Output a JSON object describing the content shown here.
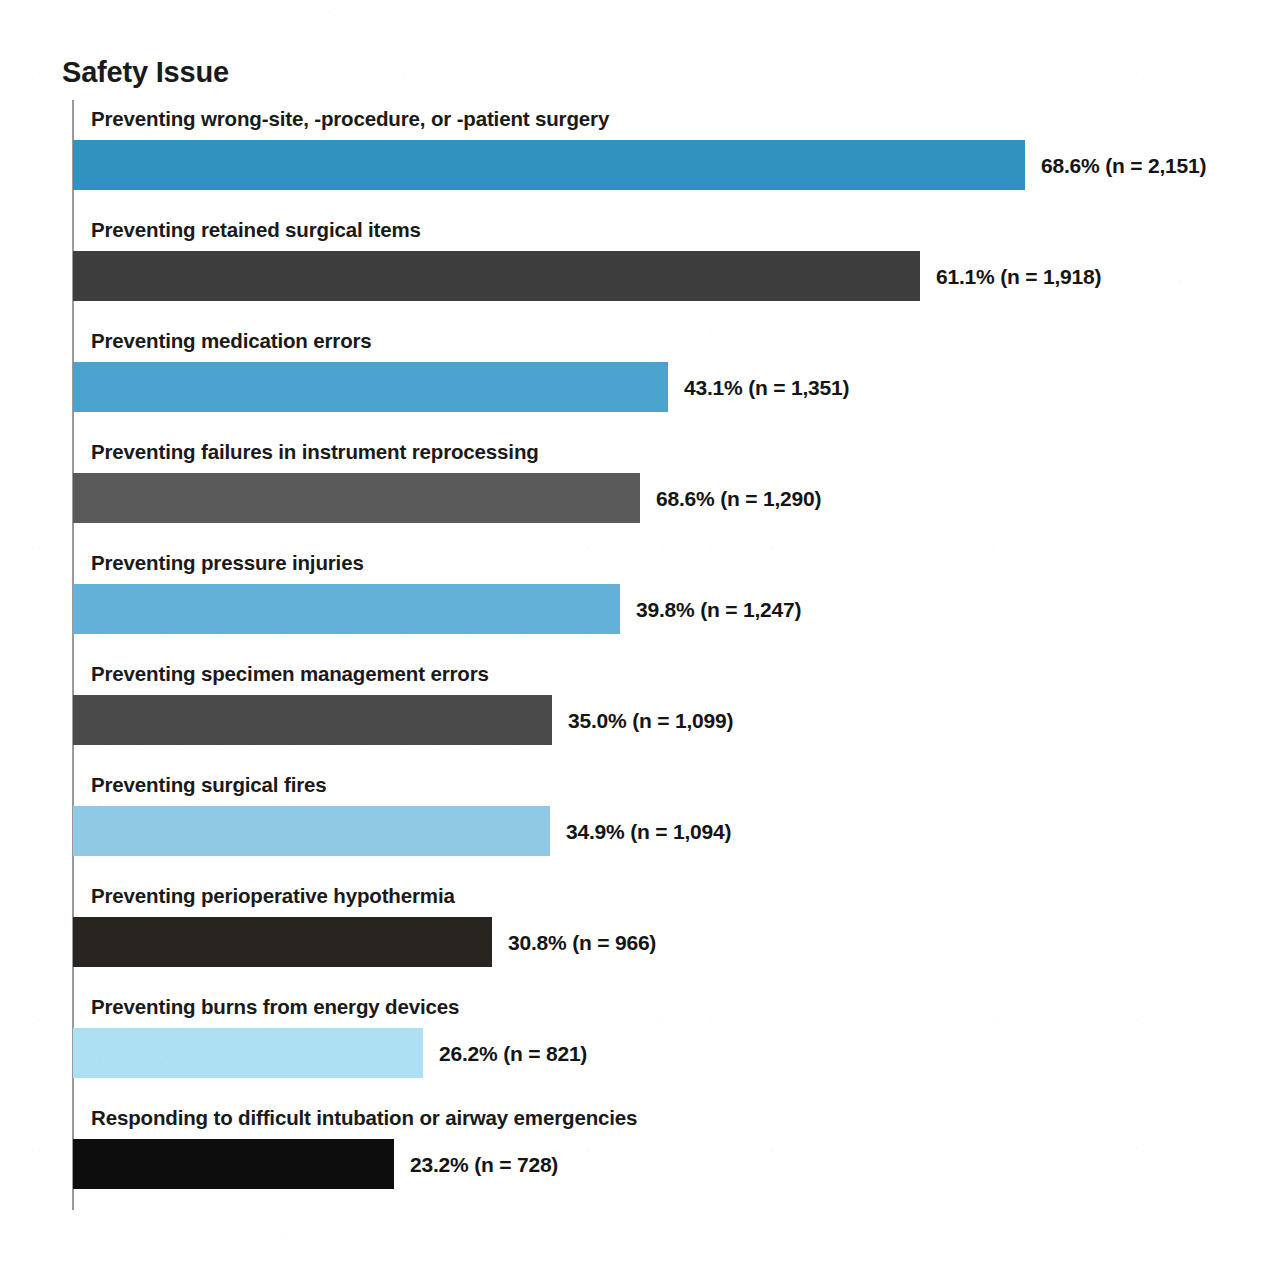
{
  "chart_data": {
    "type": "bar",
    "orientation": "horizontal",
    "title": "Safety Issue",
    "xlabel": "",
    "ylabel": "Safety Issue",
    "grid": false,
    "legend": null,
    "axis": {
      "category_axis_visible": true,
      "value_axis_visible": false,
      "value_range_n": [
        0,
        2500
      ]
    },
    "categories": [
      "Preventing wrong-site, -procedure, or -patient surgery",
      "Preventing retained surgical items",
      "Preventing medication errors",
      "Preventing failures in instrument reprocessing",
      "Preventing pressure injuries",
      "Preventing specimen management errors",
      "Preventing surgical fires",
      "Preventing perioperative hypothermia",
      "Preventing burns from energy devices",
      "Responding to difficult intubation or airway emergencies"
    ],
    "values": [
      2151,
      1918,
      1351,
      1290,
      1247,
      1099,
      1094,
      966,
      821,
      728
    ],
    "percentages": [
      68.6,
      61.1,
      43.1,
      68.6,
      39.8,
      35.0,
      34.9,
      30.8,
      26.2,
      23.2
    ],
    "value_labels": [
      "68.6% (n = 2,151)",
      "61.1% (n = 1,918)",
      "43.1% (n = 1,351)",
      "68.6% (n = 1,290)",
      "39.8% (n = 1,247)",
      "35.0% (n = 1,099)",
      "34.9% (n = 1,094)",
      "30.8% (n = 966)",
      "26.2% (n = 821)",
      "23.2% (n = 728)"
    ],
    "bar_colors": [
      "#3092bf",
      "#3d3d3d",
      "#4aa3ce",
      "#5a5a5a",
      "#63b0d8",
      "#4a4a4a",
      "#8ecae3",
      "#282420",
      "#ace0f2",
      "#0d0d0d"
    ],
    "bar_pixel_widths": [
      952,
      847,
      595,
      567,
      547,
      479,
      477,
      419,
      350,
      321
    ]
  },
  "rows": [
    {
      "label": "Preventing wrong-site, -procedure, or -patient surgery",
      "value_label": "68.6% (n = 2,151)"
    },
    {
      "label": "Preventing retained surgical items",
      "value_label": "61.1% (n = 1,918)"
    },
    {
      "label": "Preventing medication errors",
      "value_label": "43.1% (n = 1,351)"
    },
    {
      "label": "Preventing failures in instrument reprocessing",
      "value_label": "68.6% (n = 1,290)"
    },
    {
      "label": "Preventing pressure injuries",
      "value_label": "39.8% (n = 1,247)"
    },
    {
      "label": "Preventing specimen management errors",
      "value_label": "35.0% (n = 1,099)"
    },
    {
      "label": "Preventing surgical fires",
      "value_label": "34.9% (n = 1,094)"
    },
    {
      "label": "Preventing perioperative hypothermia",
      "value_label": "30.8% (n = 966)"
    },
    {
      "label": "Preventing burns from energy devices",
      "value_label": "26.2% (n = 821)"
    },
    {
      "label": "Responding to difficult intubation or airway emergencies",
      "value_label": "23.2% (n = 728)"
    }
  ]
}
